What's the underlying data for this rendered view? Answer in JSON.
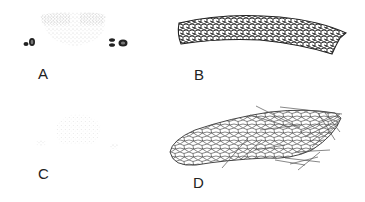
{
  "figure": {
    "panels": [
      {
        "id": "A",
        "label": "A",
        "description": "stippled tissue cross-section with two dark cell clusters on either side"
      },
      {
        "id": "B",
        "label": "B",
        "description": "curved elongated band of densely packed cells"
      },
      {
        "id": "C",
        "label": "C",
        "description": "faint stippled cross-section with two small lateral patches"
      },
      {
        "id": "D",
        "label": "D",
        "description": "elongated cellular structure with fibrous strands at one end"
      }
    ],
    "colors": {
      "ink": "#222222",
      "stipple": "#555555",
      "background": "#ffffff"
    }
  }
}
